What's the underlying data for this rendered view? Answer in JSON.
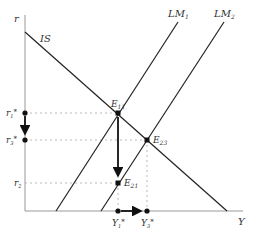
{
  "diagram": {
    "type": "IS-LM diagram",
    "axes": {
      "y_label": "r",
      "x_label": "Y"
    },
    "curves": [
      {
        "name": "IS",
        "label": "IS"
      },
      {
        "name": "LM1",
        "label": "LM",
        "sub": "1"
      },
      {
        "name": "LM2",
        "label": "LM",
        "sub": "2"
      }
    ],
    "points": [
      {
        "name": "E11",
        "label": "E",
        "sub": "11"
      },
      {
        "name": "E23",
        "label": "E",
        "sub": "23"
      },
      {
        "name": "E21",
        "label": "E",
        "sub": "21"
      }
    ],
    "y_ticks": [
      {
        "label": "r",
        "sub": "1",
        "star": "*"
      },
      {
        "label": "r",
        "sub": "3",
        "star": "*"
      },
      {
        "label": "r",
        "sub": "2",
        "star": ""
      }
    ],
    "x_ticks": [
      {
        "label": "Y",
        "sub": "1",
        "star": "*"
      },
      {
        "label": "Y",
        "sub": "3",
        "star": "*"
      }
    ],
    "colors": {
      "line": "#222222",
      "axis": "#999999",
      "dashed": "#aaaaaa",
      "text": "#333333"
    }
  }
}
